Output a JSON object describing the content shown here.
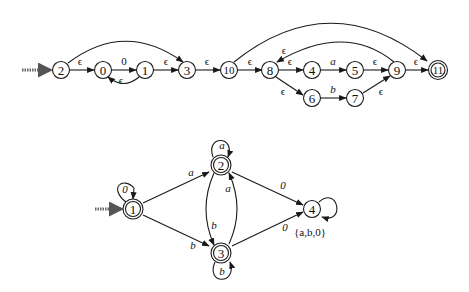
{
  "diagrams": [
    {
      "id": "nfa",
      "type": "epsilon-NFA",
      "start_state": "2",
      "accept_states": [
        "11"
      ],
      "states": [
        "2",
        "0",
        "1",
        "3",
        "10",
        "8",
        "4",
        "5",
        "6",
        "7",
        "9",
        "11"
      ],
      "transitions": [
        {
          "from": "2",
          "to": "0",
          "label": "ϵ"
        },
        {
          "from": "0",
          "to": "1",
          "label": "0"
        },
        {
          "from": "1",
          "to": "0",
          "label": "ϵ"
        },
        {
          "from": "1",
          "to": "3",
          "label": "ϵ"
        },
        {
          "from": "2",
          "to": "3",
          "label": ""
        },
        {
          "from": "3",
          "to": "10",
          "label": "ϵ"
        },
        {
          "from": "10",
          "to": "8",
          "label": "ϵ"
        },
        {
          "from": "10",
          "to": "11",
          "label": ""
        },
        {
          "from": "8",
          "to": "4",
          "label": "ϵ"
        },
        {
          "from": "4",
          "to": "5",
          "label": "a"
        },
        {
          "from": "5",
          "to": "9",
          "label": "ϵ"
        },
        {
          "from": "8",
          "to": "6",
          "label": "ϵ"
        },
        {
          "from": "6",
          "to": "7",
          "label": "b"
        },
        {
          "from": "7",
          "to": "9",
          "label": "ϵ"
        },
        {
          "from": "9",
          "to": "8",
          "label": "ϵ"
        },
        {
          "from": "9",
          "to": "11",
          "label": "ϵ"
        }
      ]
    },
    {
      "id": "dfa",
      "type": "DFA",
      "start_state": "1",
      "accept_states": [
        "1",
        "2",
        "3"
      ],
      "states": [
        "1",
        "2",
        "3",
        "4"
      ],
      "transitions": [
        {
          "from": "1",
          "to": "1",
          "label": "0"
        },
        {
          "from": "1",
          "to": "2",
          "label": "a"
        },
        {
          "from": "1",
          "to": "3",
          "label": "b"
        },
        {
          "from": "2",
          "to": "2",
          "label": "a"
        },
        {
          "from": "2",
          "to": "3",
          "label": "b"
        },
        {
          "from": "2",
          "to": "4",
          "label": "0"
        },
        {
          "from": "3",
          "to": "2",
          "label": "a"
        },
        {
          "from": "3",
          "to": "3",
          "label": "b"
        },
        {
          "from": "3",
          "to": "4",
          "label": "0"
        },
        {
          "from": "4",
          "to": "4",
          "label": "{a,b,0}"
        }
      ]
    }
  ],
  "labels": {
    "n2": "2",
    "n0": "0",
    "n1": "1",
    "n3": "3",
    "n10": "10",
    "n8": "8",
    "n4": "4",
    "n5": "5",
    "n6": "6",
    "n7": "7",
    "n9": "9",
    "n11": "11",
    "e_2_0": "ϵ",
    "e_0_1": "0",
    "e_1_0": "ϵ",
    "e_1_3": "ϵ",
    "e_3_10": "ϵ",
    "e_10_8": "ϵ",
    "e_8_4": "ϵ",
    "e_4_5": "a",
    "e_5_9": "ϵ",
    "e_8_6": "ϵ",
    "e_6_7": "b",
    "e_7_9": "ϵ",
    "e_9_8": "ϵ",
    "e_9_11": "ϵ",
    "d1": "1",
    "d2": "2",
    "d3": "3",
    "d4": "4",
    "d_1_1": "0",
    "d_1_2": "a",
    "d_1_3": "b",
    "d_2_2": "a",
    "d_2_3": "b",
    "d_3_2": "a",
    "d_3_3": "b",
    "d_2_4": "0",
    "d_3_4": "0",
    "d_4_4": "{a,b,0}"
  }
}
